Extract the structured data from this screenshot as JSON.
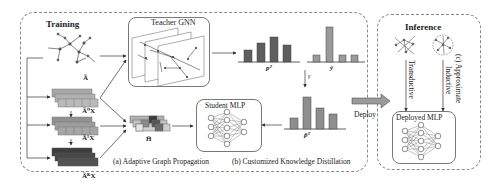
{
  "training": {
    "title": "Training",
    "adjacency_label": "Ã",
    "feature_labels": [
      "Ã⁰X",
      "Ã¹X",
      "ÃᴷX"
    ],
    "ellipsis": "...",
    "combined_label": "H̃",
    "teacher_title": "Teacher GNN",
    "student_title": "Student MLP",
    "teacher_output_label": "pᵀ",
    "soft_label": "ŷ",
    "gamma": "γ",
    "student_target_label": "p̃ᵀ",
    "caption_a": "(a) Adaptive Graph Propagation",
    "caption_b": "(b) Customized Knowledge Distillation"
  },
  "deploy": {
    "label": "Deploy"
  },
  "inference": {
    "title": "Inference",
    "transductive_label": "Transductive",
    "inductive_label": "Inductive",
    "caption_c": "(c) Approximate",
    "deployed_title": "Deployed MLP"
  },
  "chart_bars": {
    "teacher_p": [
      0.45,
      0.7,
      0.9,
      0.6
    ],
    "y_hat": [
      0.25,
      1.0,
      0.25,
      0.25
    ],
    "p_tilde": [
      0.4,
      1.0,
      0.7,
      0.55
    ]
  },
  "colors": {
    "dark_bar": "#5a5a5a",
    "light_bar": "#9a9a9a",
    "dashed_border": "#888888",
    "block_light": "#b5b5b5",
    "block_mid": "#8e8e8e",
    "block_dark": "#4a4a4a"
  }
}
